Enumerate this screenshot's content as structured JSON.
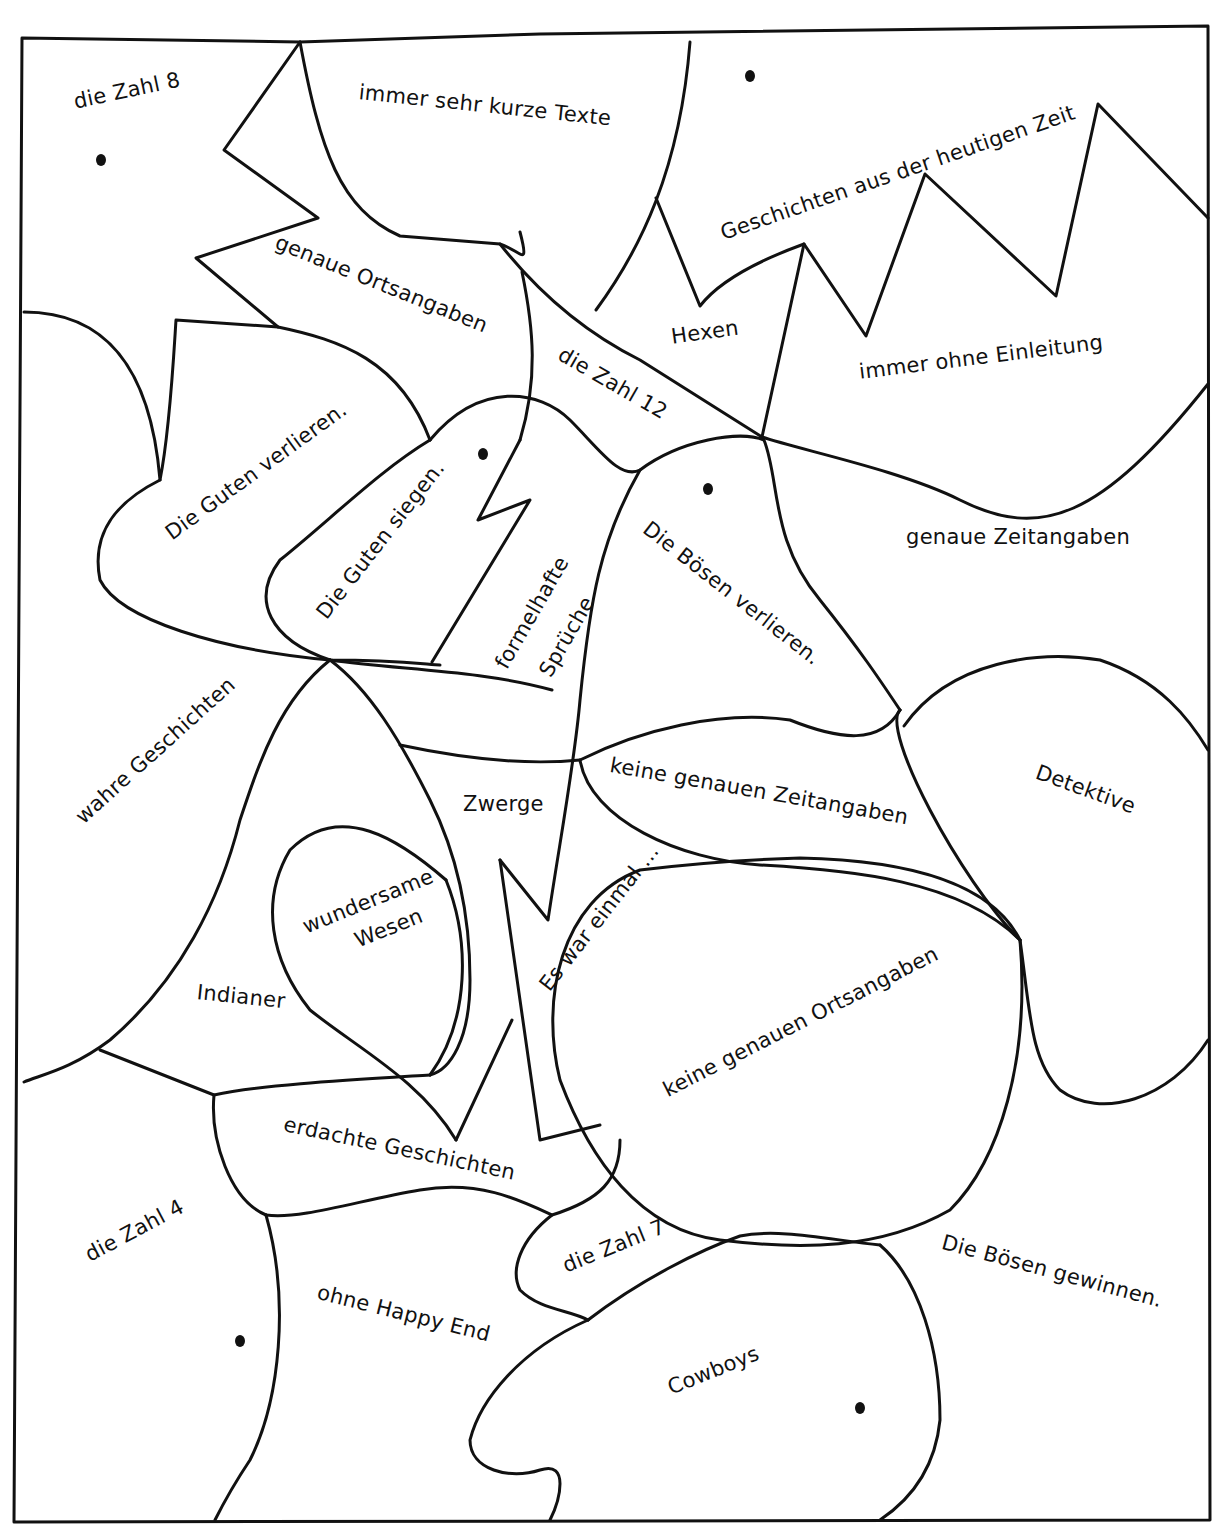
{
  "worksheet": {
    "type": "coloring-puzzle",
    "regions": [
      {
        "id": "zahl-8",
        "label": "die Zahl 8",
        "x": 72,
        "y": 110,
        "rot": -12
      },
      {
        "id": "kurze-texte",
        "label": "immer sehr kurze Texte",
        "x": 360,
        "y": 100,
        "rot": 6
      },
      {
        "id": "heutige-zeit",
        "label": "Geschichten aus der heutigen Zeit",
        "x": 718,
        "y": 242,
        "rot": -19
      },
      {
        "id": "genaue-orte",
        "label": "genaue Ortsangaben",
        "x": 280,
        "y": 250,
        "rot": 22
      },
      {
        "id": "hexen",
        "label": "Hexen",
        "x": 670,
        "y": 345,
        "rot": -8
      },
      {
        "id": "ohne-einleitung",
        "label": "immer ohne Einleitung",
        "x": 858,
        "y": 380,
        "rot": -7
      },
      {
        "id": "zahl-12",
        "label": "die Zahl 12",
        "x": 565,
        "y": 362,
        "rot": 30
      },
      {
        "id": "guten-verlieren",
        "label": "Die Guten verlieren.",
        "x": 162,
        "y": 545,
        "rot": -36
      },
      {
        "id": "guten-siegen",
        "label": "Die Guten siegen.",
        "x": 313,
        "y": 628,
        "rot": -52
      },
      {
        "id": "formelhafte",
        "label": "formelhafte",
        "x": 492,
        "y": 680,
        "rot": -60
      },
      {
        "id": "sprueche",
        "label": "Sprüche",
        "x": 536,
        "y": 688,
        "rot": -60
      },
      {
        "id": "boesen-verlieren",
        "label": "Die Bösen verlieren.",
        "x": 652,
        "y": 536,
        "rot": 38
      },
      {
        "id": "genaue-zeit",
        "label": "genaue Zeitangaben",
        "x": 906,
        "y": 545,
        "rot": 0
      },
      {
        "id": "wahre",
        "label": "wahre Geschichten",
        "x": 72,
        "y": 830,
        "rot": -42
      },
      {
        "id": "detektive",
        "label": "Detektive",
        "x": 1040,
        "y": 780,
        "rot": 20
      },
      {
        "id": "keine-zeit",
        "label": "keine genauen Zeitangaben",
        "x": 612,
        "y": 773,
        "rot": 10
      },
      {
        "id": "zwerge",
        "label": "Zwerge",
        "x": 463,
        "y": 812,
        "rot": 0
      },
      {
        "id": "wundersame",
        "label": "wundersame",
        "x": 300,
        "y": 936,
        "rot": -22
      },
      {
        "id": "wesen",
        "label": "Wesen",
        "x": 352,
        "y": 950,
        "rot": -22
      },
      {
        "id": "es-war-einmal",
        "label": "Es war einmal ...",
        "x": 536,
        "y": 1000,
        "rot": -52
      },
      {
        "id": "indianer",
        "label": "Indianer",
        "x": 198,
        "y": 1000,
        "rot": 6
      },
      {
        "id": "keine-orte",
        "label": "keine genauen Ortsangaben",
        "x": 660,
        "y": 1100,
        "rot": -27
      },
      {
        "id": "erdachte",
        "label": "erdachte Geschichten",
        "x": 286,
        "y": 1132,
        "rot": 12
      },
      {
        "id": "zahl-4",
        "label": "die Zahl 4",
        "x": 82,
        "y": 1265,
        "rot": -28
      },
      {
        "id": "zahl-7",
        "label": "die Zahl 7",
        "x": 560,
        "y": 1275,
        "rot": -22
      },
      {
        "id": "boesen-gewinnen",
        "label": "Die Bösen gewinnen.",
        "x": 945,
        "y": 1250,
        "rot": 15
      },
      {
        "id": "happy-end",
        "label": "ohne Happy End",
        "x": 320,
        "y": 1300,
        "rot": 14
      },
      {
        "id": "cowboys",
        "label": "Cowboys",
        "x": 665,
        "y": 1397,
        "rot": -22
      }
    ],
    "dots": [
      {
        "x": 101,
        "y": 160
      },
      {
        "x": 750,
        "y": 76
      },
      {
        "x": 483,
        "y": 454
      },
      {
        "x": 708,
        "y": 489
      },
      {
        "x": 240,
        "y": 1341
      },
      {
        "x": 860,
        "y": 1408
      }
    ]
  }
}
